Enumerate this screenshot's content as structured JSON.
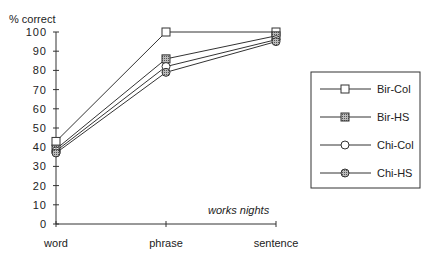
{
  "chart_data": {
    "type": "line",
    "title": "",
    "ylabel": "% correct",
    "xlabel": "",
    "categories": [
      "word",
      "phrase",
      "sentence"
    ],
    "ylim": [
      0,
      100
    ],
    "yticks": [
      0,
      10,
      20,
      30,
      40,
      50,
      60,
      70,
      80,
      90,
      100
    ],
    "grid": false,
    "legend_position": "right",
    "annotation": "works nights",
    "series": [
      {
        "name": "Bir-Col",
        "marker": "square-open",
        "values": [
          43,
          100,
          100
        ]
      },
      {
        "name": "Bir-HS",
        "marker": "square-hatched",
        "values": [
          39,
          86,
          98
        ]
      },
      {
        "name": "Chi-Col",
        "marker": "circle-open",
        "values": [
          38,
          82,
          96
        ]
      },
      {
        "name": "Chi-HS",
        "marker": "circle-hatched",
        "values": [
          37,
          79,
          95
        ]
      }
    ]
  },
  "colors": {
    "line": "#333333",
    "marker_fill_hatched": "#9a9a9a",
    "marker_fill_open": "#ffffff"
  }
}
